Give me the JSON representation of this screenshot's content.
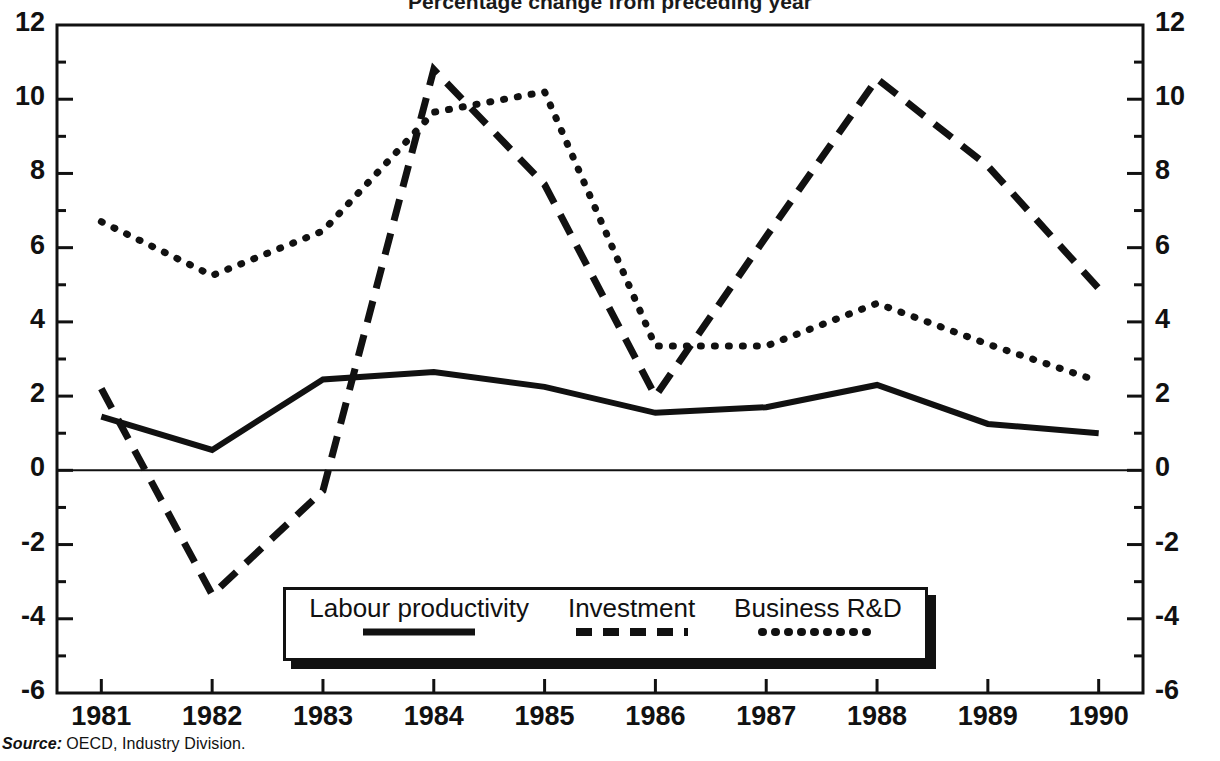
{
  "chart_data": {
    "type": "line",
    "title": "Percentage change from preceding year",
    "xlabel": "",
    "ylabel": "",
    "x": [
      1981,
      1982,
      1983,
      1984,
      1985,
      1986,
      1987,
      1988,
      1989,
      1990
    ],
    "categories": [
      "1981",
      "1982",
      "1983",
      "1984",
      "1985",
      "1986",
      "1987",
      "1988",
      "1989",
      "1990"
    ],
    "xlim": [
      1980.6,
      1990.4
    ],
    "ylim": [
      -6,
      12
    ],
    "y_ticks": [
      -6,
      -4,
      -2,
      0,
      2,
      4,
      6,
      8,
      10,
      12
    ],
    "y_tick_labels": [
      "-6",
      "-4",
      "-2",
      "0",
      "2",
      "4",
      "6",
      "8",
      "10",
      "12"
    ],
    "y_minor_step": 1,
    "grid": false,
    "legend_position": "bottom-center",
    "dual_axis": true,
    "zero_line": true,
    "series": [
      {
        "name": "Labour productivity",
        "style": "solid",
        "color": "#111111",
        "values": [
          1.45,
          0.55,
          2.45,
          2.65,
          2.25,
          1.55,
          1.7,
          2.3,
          1.25,
          1.0
        ]
      },
      {
        "name": "Investment",
        "style": "dashed",
        "color": "#111111",
        "values": [
          2.2,
          -3.35,
          -0.55,
          10.8,
          7.7,
          2.0,
          6.3,
          10.55,
          8.2,
          4.9
        ]
      },
      {
        "name": "Business R&D",
        "style": "dotted",
        "color": "#111111",
        "values": [
          6.7,
          5.25,
          6.45,
          9.65,
          10.2,
          3.35,
          3.35,
          4.5,
          3.4,
          2.4
        ]
      }
    ]
  },
  "axes": {
    "left_tick_labels": [
      "12",
      "10",
      "8",
      "6",
      "4",
      "2",
      "0",
      "-2",
      "-4",
      "-6"
    ],
    "right_tick_labels": [
      "12",
      "10",
      "8",
      "6",
      "4",
      "2",
      "0",
      "-2",
      "-4",
      "-6"
    ],
    "x_tick_labels": [
      "1981",
      "1982",
      "1983",
      "1984",
      "1985",
      "1986",
      "1987",
      "1988",
      "1989",
      "1990"
    ]
  },
  "legend": {
    "items": [
      {
        "label": "Labour productivity",
        "style": "solid"
      },
      {
        "label": "Investment",
        "style": "dashed"
      },
      {
        "label": "Business R&D",
        "style": "dotted"
      }
    ]
  },
  "source": {
    "label": "Source:",
    "text": "OECD, Industry Division."
  }
}
